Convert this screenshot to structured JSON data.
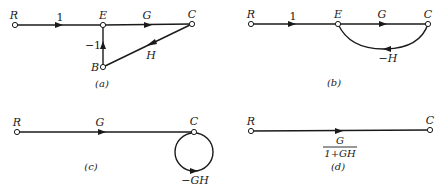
{
  "panels": {
    "a": {
      "caption": "(a)",
      "nodes": {
        "R": "R",
        "E": "E",
        "C": "C",
        "B": "B"
      },
      "edges": [
        {
          "from": "R",
          "to": "E",
          "gain": "1"
        },
        {
          "from": "E",
          "to": "C",
          "gain": "G"
        },
        {
          "from": "C",
          "to": "B",
          "gain": "H"
        },
        {
          "from": "B",
          "to": "E",
          "gain": "−1"
        }
      ]
    },
    "b": {
      "caption": "(b)",
      "nodes": {
        "R": "R",
        "E": "E",
        "C": "C"
      },
      "edges": [
        {
          "from": "R",
          "to": "E",
          "gain": "1"
        },
        {
          "from": "E",
          "to": "C",
          "gain": "G"
        },
        {
          "from": "C",
          "to": "E",
          "gain": "−H"
        }
      ]
    },
    "c": {
      "caption": "(c)",
      "nodes": {
        "R": "R",
        "C": "C"
      },
      "edges": [
        {
          "from": "R",
          "to": "C",
          "gain": "G"
        },
        {
          "from": "C",
          "to": "C",
          "gain": "−GH"
        }
      ]
    },
    "d": {
      "caption": "(d)",
      "nodes": {
        "R": "R",
        "C": "C"
      },
      "edges": [
        {
          "from": "R",
          "to": "C",
          "gain_numerator": "G",
          "gain_denominator": "1+GH"
        }
      ]
    }
  }
}
